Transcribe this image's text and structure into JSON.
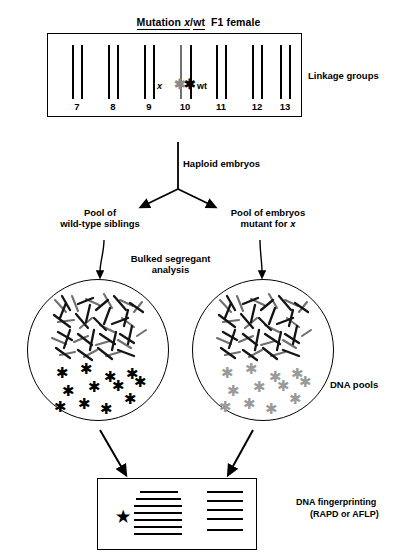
{
  "figure": {
    "title": {
      "mutation_word": "Mutation",
      "mutation_allele": "x",
      "slash": "/",
      "wt": "wt",
      "generation": "F1 female"
    },
    "linkage_panel": {
      "side_label": "Linkage groups",
      "groups": [
        {
          "number": "7",
          "x": 30
        },
        {
          "number": "8",
          "x": 66
        },
        {
          "number": "9",
          "x": 102
        },
        {
          "number": "10",
          "x": 138
        },
        {
          "number": "11",
          "x": 174
        },
        {
          "number": "12",
          "x": 210
        },
        {
          "number": "13",
          "x": 240
        }
      ],
      "marker": {
        "left_allele_label": "x",
        "left_star_color": "#8a8a8a",
        "right_star_color": "#000000",
        "right_allele_label": "wt"
      }
    },
    "flow": {
      "haploid_label": "Haploid embryos",
      "left_pool_line1": "Pool of",
      "left_pool_line2": "wild-type siblings",
      "right_pool_line1": "Pool of embryos",
      "right_pool_line2_prefix": "mutant for",
      "right_pool_line2_allele": "x",
      "bulked_line1": "Bulked segregant",
      "bulked_line2": "analysis"
    },
    "dna_pools": {
      "side_label": "DNA pools",
      "left_circle": {
        "marker_star_color": "#000000",
        "marker_count": 12
      },
      "right_circle": {
        "marker_star_color": "#9a9a9a",
        "marker_count": 12
      }
    },
    "gel": {
      "side_label_line1": "DNA fingerprinting",
      "side_label_line2": "(RAPD or AFLP)",
      "star_glyph": "★",
      "lanes": [
        {
          "name": "left-lane",
          "bands_y": [
            12,
            19,
            26,
            33,
            40,
            47,
            54
          ]
        },
        {
          "name": "right-lane",
          "bands_y": [
            12,
            21,
            30,
            39,
            50
          ]
        }
      ]
    },
    "colors": {
      "ink": "#000000",
      "gray_chromatin": "#777777",
      "gray_marker": "#9a9a9a",
      "background": "#ffffff"
    }
  }
}
